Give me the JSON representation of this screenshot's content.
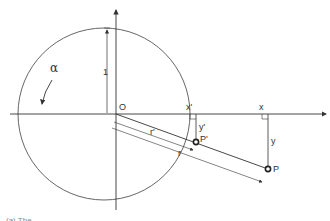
{
  "diagram": {
    "labels": {
      "origin": "O",
      "unit_radius": "1",
      "angle": "α",
      "x_prime": "x'",
      "x": "x",
      "y_prime": "y'",
      "y": "y",
      "r_prime": "r'",
      "r": "r",
      "p_prime": "P'",
      "p": "P"
    },
    "caption": "(a) The ..."
  },
  "colors": {
    "line": "#333333",
    "background": "#ffffff"
  }
}
